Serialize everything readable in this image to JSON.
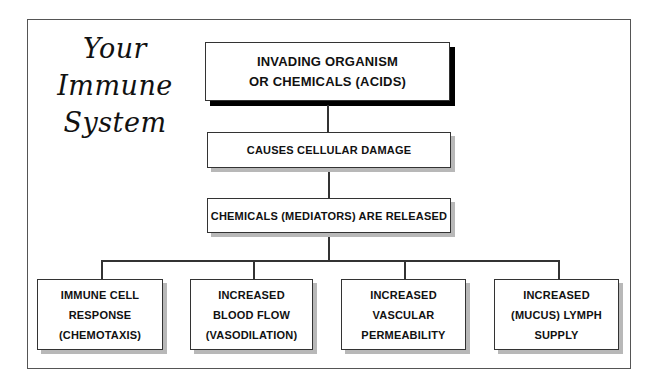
{
  "title": {
    "lines": [
      "Your",
      "Immune",
      "System"
    ]
  },
  "flow": {
    "step1": {
      "line1": "INVADING ORGANISM",
      "line2": "OR CHEMICALS (ACIDS)"
    },
    "step2": {
      "label": "CAUSES CELLULAR DAMAGE"
    },
    "step3": {
      "label": "CHEMICALS (MEDIATORS) ARE RELEASED"
    },
    "outcomes": [
      {
        "lines": [
          "IMMUNE CELL",
          "RESPONSE",
          "(CHEMOTAXIS)"
        ]
      },
      {
        "lines": [
          "INCREASED",
          "BLOOD FLOW",
          "(VASODILATION)"
        ]
      },
      {
        "lines": [
          "INCREASED",
          "VASCULAR",
          "PERMEABILITY"
        ]
      },
      {
        "lines": [
          "INCREASED",
          "(MUCUS) LYMPH",
          "SUPPLY"
        ]
      }
    ]
  }
}
